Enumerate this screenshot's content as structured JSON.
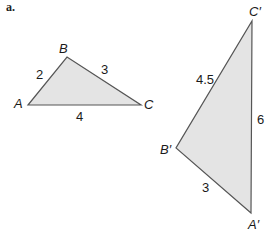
{
  "part_label": "a.",
  "colors": {
    "fill": "#e4e4e4",
    "stroke": "#555555",
    "text": "#1a1a1a"
  },
  "triangle_abc": {
    "vertices": {
      "A": "A",
      "B": "B",
      "C": "C"
    },
    "sides": {
      "AB": "2",
      "BC": "3",
      "AC": "4"
    }
  },
  "triangle_abc_prime": {
    "vertices": {
      "A": "A′",
      "B": "B′",
      "C": "C′"
    },
    "sides": {
      "BC": "4.5",
      "AC": "6",
      "AB": "3"
    }
  }
}
